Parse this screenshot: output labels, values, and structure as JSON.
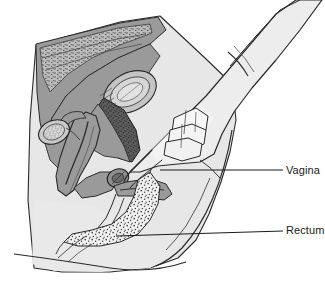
{
  "figure": {
    "width": 325,
    "height": 288,
    "background_color": "#ffffff"
  },
  "labels": [
    {
      "id": "vagina",
      "text": "Vagina",
      "leader": {
        "x1": 160,
        "y1": 170,
        "x2": 283,
        "y2": 170
      },
      "text_x": 286,
      "text_y": 164
    },
    {
      "id": "rectum",
      "text": "Rectum",
      "leader": {
        "x1": 116,
        "y1": 236,
        "x2": 283,
        "y2": 231
      },
      "text_x": 286,
      "text_y": 224
    }
  ],
  "colors": {
    "background": "#ffffff",
    "body_fill": "#e7e7e7",
    "body_fill_light": "#efefef",
    "hand_fill": "#ededed",
    "organ_mid_gray": "#9a9a9a",
    "organ_dark_gray": "#5d5d5d",
    "organ_light_gray": "#c4c4c4",
    "stipple_dot": "#4a4a4a",
    "outline": "#1a1a1a",
    "label_text": "#1a1a1a"
  },
  "structures": [
    {
      "id": "torso-outline",
      "name": "abdominal and pelvic body outline",
      "fill": "#e7e7e7"
    },
    {
      "id": "abdominal-wall",
      "name": "anterior abdominal wall with muscle layer",
      "fill": "#9a9a9a"
    },
    {
      "id": "symphysis-pubis",
      "name": "symphysis pubis / pubic bone",
      "fill": "#c4c4c4"
    },
    {
      "id": "bladder",
      "name": "urinary bladder",
      "fill": "#9a9a9a"
    },
    {
      "id": "pubic-dark-mass",
      "name": "dark stippled pubic region",
      "fill": "#5d5d5d"
    },
    {
      "id": "uterus",
      "name": "uterus body and fundus",
      "fill": "#9a9a9a"
    },
    {
      "id": "cervix",
      "name": "cervix",
      "fill": "#8e8e8e"
    },
    {
      "id": "ovary",
      "name": "ovary",
      "fill": "#c9c9c9"
    },
    {
      "id": "fallopian-tube",
      "name": "fallopian tube",
      "fill": "#9a9a9a"
    },
    {
      "id": "vaginal-canal",
      "name": "vaginal canal",
      "fill": "#9a9a9a"
    },
    {
      "id": "rectum-stippled",
      "name": "rectum with stippled contents",
      "fill": "#ffffff"
    },
    {
      "id": "examining-hand",
      "name": "gloved examining hand",
      "fill": "#ededed"
    },
    {
      "id": "folded-fingers",
      "name": "folded fingers of examining hand",
      "fill": "#f5f5f5"
    },
    {
      "id": "glove-cuff",
      "name": "glove cuff at wrist",
      "fill": "#ffffff"
    },
    {
      "id": "thigh",
      "name": "thigh and buttock contour",
      "fill": "#e7e7e7"
    }
  ]
}
